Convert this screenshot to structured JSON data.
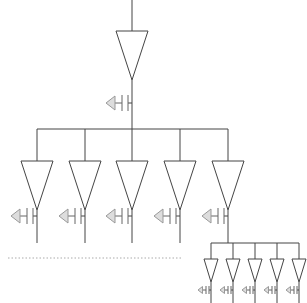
{
  "diagram": {
    "type": "clock-tree buffer distribution",
    "colors": {
      "wire": "#444444",
      "cap_ground": "#dddddd",
      "separator": "#aaaaaa"
    },
    "root": {
      "input_line": {
        "x": 132,
        "y1": 0,
        "y2": 31
      },
      "buffer": {
        "cx": 132,
        "top": 31,
        "half_width": 16,
        "tip": 80
      },
      "cap": {
        "y": 103
      },
      "out_line_end": 129
    },
    "level1": {
      "bus_y": 129,
      "bus_x1": 37,
      "bus_x2": 228,
      "buffer_top": 161,
      "buffer_tip": 210,
      "half_width": 16,
      "cap_y": 216,
      "line_end": 243,
      "branches": [
        {
          "x": 37
        },
        {
          "x": 85
        },
        {
          "x": 132
        },
        {
          "x": 180
        },
        {
          "x": 228,
          "continues": true
        }
      ]
    },
    "level2": {
      "bus_y": 243,
      "bus_x1": 211,
      "bus_x2": 299,
      "buffer_top": 259,
      "buffer_tip": 282,
      "half_width": 7,
      "cap_y": 290,
      "line_end": 303,
      "branches": [
        {
          "x": 211
        },
        {
          "x": 233
        },
        {
          "x": 255
        },
        {
          "x": 277
        },
        {
          "x": 299
        }
      ]
    },
    "separator": {
      "y": 258,
      "x1": 8,
      "x2": 183
    }
  }
}
